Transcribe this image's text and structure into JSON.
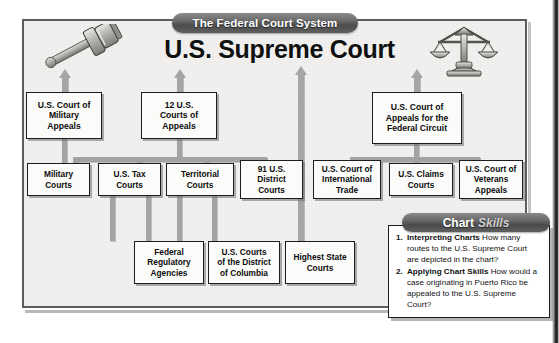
{
  "banner": {
    "title": "The Federal Court System"
  },
  "heading": {
    "title": "U.S. Supreme Court"
  },
  "icons": {
    "left": "gavel-icon",
    "right": "scales-of-justice-icon"
  },
  "chart_data": {
    "type": "diagram",
    "title": "The Federal Court System",
    "root": "U.S. Supreme Court",
    "nodes": [
      {
        "id": "military_appeals",
        "label": "U.S. Court of Military Appeals",
        "tier": 2
      },
      {
        "id": "courts_of_appeals",
        "label": "12 U.S. Courts of Appeals",
        "tier": 2
      },
      {
        "id": "federal_circuit",
        "label": "U.S. Court of Appeals for the Federal Circuit",
        "tier": 2
      },
      {
        "id": "military_courts",
        "label": "Military Courts",
        "tier": 3
      },
      {
        "id": "tax_courts",
        "label": "U.S. Tax Courts",
        "tier": 3
      },
      {
        "id": "territorial_courts",
        "label": "Territorial Courts",
        "tier": 3
      },
      {
        "id": "district_courts",
        "label": "91 U.S. District Courts",
        "tier": 3
      },
      {
        "id": "international_trade",
        "label": "U.S. Court of International Trade",
        "tier": 3
      },
      {
        "id": "claims_courts",
        "label": "U.S. Claims Courts",
        "tier": 3
      },
      {
        "id": "veterans_appeals",
        "label": "U.S. Court of Veterans Appeals",
        "tier": 3
      },
      {
        "id": "regulatory_agencies",
        "label": "Federal Regulatory Agencies",
        "tier": 4
      },
      {
        "id": "dc_courts",
        "label": "U.S. Courts of the District of Columbia",
        "tier": 4
      },
      {
        "id": "highest_state",
        "label": "Highest State Courts",
        "tier": 4
      }
    ],
    "edges": [
      {
        "from": "military_appeals",
        "to": "U.S. Supreme Court",
        "arrow": true
      },
      {
        "from": "courts_of_appeals",
        "to": "U.S. Supreme Court",
        "arrow": true
      },
      {
        "from": "highest_state",
        "to": "U.S. Supreme Court",
        "arrow": true
      },
      {
        "from": "federal_circuit",
        "to": "U.S. Supreme Court",
        "arrow": true
      },
      {
        "from": "military_courts",
        "to": "military_appeals"
      },
      {
        "from": "tax_courts",
        "to": "courts_of_appeals"
      },
      {
        "from": "territorial_courts",
        "to": "courts_of_appeals"
      },
      {
        "from": "district_courts",
        "to": "courts_of_appeals"
      },
      {
        "from": "regulatory_agencies",
        "to": "courts_of_appeals"
      },
      {
        "from": "dc_courts",
        "to": "courts_of_appeals"
      },
      {
        "from": "international_trade",
        "to": "federal_circuit"
      },
      {
        "from": "claims_courts",
        "to": "federal_circuit"
      },
      {
        "from": "veterans_appeals",
        "to": "federal_circuit"
      }
    ]
  },
  "nodes": {
    "military_appeals": {
      "label": "U.S. Court of\nMilitary\nAppeals"
    },
    "courts_of_appeals": {
      "label": "12 U.S.\nCourts of\nAppeals"
    },
    "federal_circuit": {
      "label": "U.S. Court of\nAppeals for the\nFederal Circuit"
    },
    "military_courts": {
      "label": "Military\nCourts"
    },
    "tax_courts": {
      "label": "U.S. Tax\nCourts"
    },
    "territorial_courts": {
      "label": "Territorial\nCourts"
    },
    "district_courts": {
      "label": "91 U.S.\nDistrict\nCourts"
    },
    "international_trade": {
      "label": "U.S. Court of\nInternational\nTrade"
    },
    "claims_courts": {
      "label": "U.S. Claims\nCourts"
    },
    "veterans_appeals": {
      "label": "U.S. Court of\nVeterans\nAppeals"
    },
    "regulatory_agencies": {
      "label": "Federal\nRegulatory\nAgencies"
    },
    "dc_courts": {
      "label": "U.S. Courts\nof the District\nof Columbia"
    },
    "highest_state": {
      "label": "Highest State\nCourts"
    }
  },
  "skills": {
    "tab_bold": "Chart",
    "tab_italic": "Skills",
    "items": [
      {
        "num": "1.",
        "bold": "Interpreting Charts",
        "text": "How many routes to the U.S. Supreme Court are depicted in the chart?"
      },
      {
        "num": "2.",
        "bold": "Applying Chart Skills",
        "text": "How would a case originating in Puerto Rico be appealed to the U.S. Supreme Court?"
      }
    ]
  }
}
